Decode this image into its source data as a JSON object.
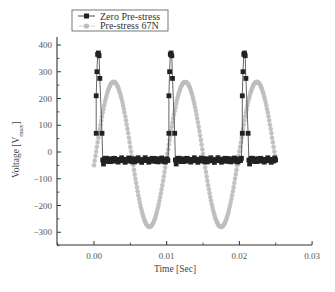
{
  "chart_data": {
    "type": "line",
    "title": "",
    "xlabel": "Time [Sec]",
    "ylabel": "Voltage [V_max]",
    "ylabel_main": "Voltage [V",
    "ylabel_sub": "max",
    "ylabel_end": "]",
    "xlim": [
      -0.005,
      0.03
    ],
    "ylim": [
      -350,
      430
    ],
    "xticks": [
      0.0,
      0.01,
      0.02,
      0.03
    ],
    "xtick_labels": [
      "0.00",
      "0.01",
      "0.02",
      "0.03"
    ],
    "yticks": [
      -300,
      -200,
      -100,
      0,
      100,
      200,
      300,
      400
    ],
    "ytick_labels": [
      "-300",
      "-200",
      "-100",
      "0",
      "100",
      "200",
      "300",
      "400"
    ],
    "grid": false,
    "legend_position": "top-left",
    "series": [
      {
        "name": "Zero Pre-stress",
        "marker": "square",
        "color": "#222222",
        "description": "Periodic short voltage spikes (~370 V) every ~0.0103 s, otherwise flat near -30 V",
        "spike_times": [
          0.0003,
          0.0103,
          0.0204
        ],
        "spike_profile": [
          {
            "dt": 0.0,
            "v": 70
          },
          {
            "dt": 0.0,
            "v": 210
          },
          {
            "dt": 0.0001,
            "v": 300
          },
          {
            "dt": 0.0002,
            "v": 365
          },
          {
            "dt": 0.0003,
            "v": 370
          },
          {
            "dt": 0.0004,
            "v": 360
          },
          {
            "dt": 0.0005,
            "v": 275
          },
          {
            "dt": 0.0008,
            "v": 70
          },
          {
            "dt": 0.0009,
            "v": -30
          },
          {
            "dt": 0.001,
            "v": -45
          }
        ],
        "baseline": -30,
        "x_end": 0.025
      },
      {
        "name": "Pre-stress 67N",
        "marker": "circle",
        "color": "#bdbdbd",
        "description": "Sinusoid, period ~0.01 s, peak ~262 V, trough ~-280 V",
        "x_start": 0.0,
        "x_end": 0.025,
        "peaks": [
          {
            "x": 0.0027,
            "y": 262
          },
          {
            "x": 0.0124,
            "y": 262
          },
          {
            "x": 0.0224,
            "y": 262
          }
        ],
        "troughs": [
          {
            "x": 0.0075,
            "y": -280
          },
          {
            "x": 0.0175,
            "y": -280
          }
        ],
        "start_value": 70,
        "end_value": -30
      }
    ]
  },
  "legend": {
    "items": [
      {
        "label": "Zero Pre-stress"
      },
      {
        "label": "Pre-stress 67N"
      }
    ]
  }
}
